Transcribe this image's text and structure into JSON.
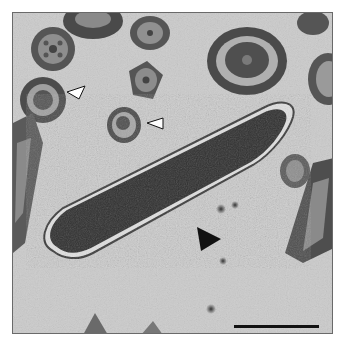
{
  "figure": {
    "type": "transmission electron micrograph",
    "background_color": "#c9c9c9",
    "arrowheads": [
      {
        "kind": "open",
        "color": "#ffffff",
        "label": "open-arrowhead-1"
      },
      {
        "kind": "open",
        "color": "#ffffff",
        "label": "open-arrowhead-2"
      },
      {
        "kind": "filled",
        "color": "#111111",
        "label": "filled-arrowhead"
      }
    ],
    "scale_bar": {
      "color": "#111111"
    }
  }
}
